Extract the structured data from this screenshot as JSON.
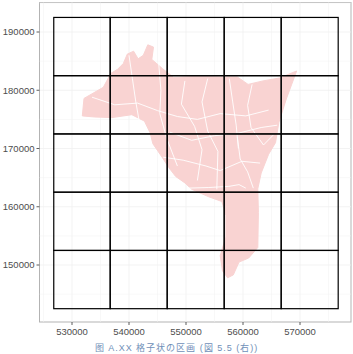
{
  "figure": {
    "caption": "图 A.XX  格子状の区画  (図 5.5 (右))",
    "panel": {
      "x0": 39.5,
      "y0": 2.5,
      "x1": 351,
      "y1": 322,
      "border": "#b3b3b3",
      "background": "#ffffff"
    },
    "grid_minor_color": "#f0f0f0",
    "region_fill": "#f9d3d2",
    "region_stroke": "#ffffff",
    "cell_stroke": "#000000"
  },
  "chart_data": {
    "type": "map",
    "title": "",
    "xlabel": "",
    "ylabel": "",
    "x_ticks": [
      530000,
      540000,
      550000,
      560000,
      570000
    ],
    "y_ticks": [
      150000,
      160000,
      170000,
      180000,
      190000
    ],
    "x_tick_labels": [
      "530000",
      "540000",
      "550000",
      "560000",
      "570000"
    ],
    "y_tick_labels": [
      "150000",
      "160000",
      "170000",
      "180000",
      "190000"
    ],
    "xlim": [
      525000,
      578000
    ],
    "ylim": [
      140000,
      195500
    ],
    "grid": {
      "description": "5 x 5 grid of square cells (10000 units each) overlaid on the region",
      "x_edges": [
        526800,
        536700,
        546700,
        556700,
        566700,
        576700
      ],
      "y_edges": [
        142500,
        152500,
        162500,
        172500,
        182500,
        192500
      ],
      "rows": 5,
      "cols": 5
    },
    "region": {
      "description": "Pink polygon made of many sub-districts with white boundaries",
      "outline": [
        [
          531800,
          175600
        ],
        [
          532100,
          178600
        ],
        [
          535500,
          180500
        ],
        [
          536800,
          182900
        ],
        [
          538000,
          183600
        ],
        [
          539000,
          184600
        ],
        [
          539700,
          186200
        ],
        [
          540800,
          186700
        ],
        [
          541600,
          185400
        ],
        [
          542500,
          186000
        ],
        [
          543300,
          187800
        ],
        [
          544300,
          187400
        ],
        [
          544000,
          185300
        ],
        [
          545900,
          183700
        ],
        [
          547800,
          182200
        ],
        [
          552000,
          182400
        ],
        [
          556000,
          182300
        ],
        [
          559000,
          182300
        ],
        [
          560900,
          181000
        ],
        [
          563500,
          181600
        ],
        [
          566400,
          182100
        ],
        [
          569400,
          183300
        ],
        [
          567600,
          178500
        ],
        [
          566300,
          174500
        ],
        [
          565700,
          171000
        ],
        [
          564500,
          169000
        ],
        [
          563200,
          165800
        ],
        [
          562600,
          163100
        ],
        [
          562700,
          159000
        ],
        [
          562600,
          153000
        ],
        [
          561000,
          151200
        ],
        [
          559300,
          150500
        ],
        [
          558300,
          148300
        ],
        [
          557300,
          147800
        ],
        [
          556400,
          149000
        ],
        [
          556000,
          151600
        ],
        [
          557000,
          154800
        ],
        [
          557000,
          158500
        ],
        [
          556300,
          160900
        ],
        [
          554000,
          161700
        ],
        [
          551000,
          163000
        ],
        [
          549800,
          164100
        ],
        [
          548200,
          165200
        ],
        [
          547000,
          166700
        ],
        [
          545800,
          168500
        ],
        [
          544200,
          170800
        ],
        [
          543700,
          172700
        ],
        [
          542700,
          174700
        ],
        [
          540500,
          175800
        ],
        [
          537000,
          175300
        ],
        [
          534000,
          175400
        ]
      ]
    }
  }
}
